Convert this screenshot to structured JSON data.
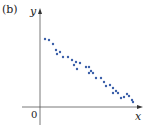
{
  "panel_label": "(b)",
  "chart_data": {
    "type": "scatter",
    "title": "",
    "xlabel": "x",
    "ylabel": "y",
    "origin_label": "0",
    "grid": false,
    "legend": null,
    "point_color": "#3a5fa8",
    "axis_color": "#555555",
    "trend": "negative linear correlation",
    "points_px": [
      [
        45,
        39
      ],
      [
        49,
        40
      ],
      [
        53,
        44
      ],
      [
        56,
        50
      ],
      [
        60,
        52
      ],
      [
        57,
        54
      ],
      [
        63,
        57
      ],
      [
        68,
        57
      ],
      [
        72,
        60
      ],
      [
        76,
        62
      ],
      [
        74,
        65
      ],
      [
        80,
        63
      ],
      [
        77,
        69
      ],
      [
        86,
        67
      ],
      [
        89,
        67
      ],
      [
        91,
        71
      ],
      [
        93,
        73
      ],
      [
        89,
        73
      ],
      [
        96,
        78
      ],
      [
        101,
        78
      ],
      [
        104,
        82
      ],
      [
        106,
        86
      ],
      [
        110,
        85
      ],
      [
        113,
        88
      ],
      [
        116,
        91
      ],
      [
        113,
        93
      ],
      [
        118,
        93
      ],
      [
        121,
        98
      ],
      [
        124,
        97
      ],
      [
        127,
        94
      ],
      [
        129,
        96
      ],
      [
        132,
        100
      ],
      [
        133,
        102
      ]
    ]
  }
}
